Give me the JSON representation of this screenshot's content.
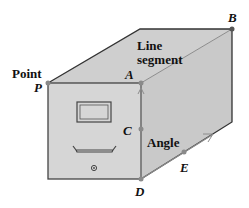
{
  "diagram": {
    "colors": {
      "fill": "#d4d4d4",
      "edge": "#333333",
      "point": "#8a8a8a",
      "accent_line": "#8c8c8c"
    },
    "terms": {
      "point": "Point",
      "line_segment_line1": "Line",
      "line_segment_line2": "segment",
      "angle": "Angle"
    },
    "points": {
      "P": "P",
      "A": "A",
      "B": "B",
      "C": "C",
      "D": "D",
      "E": "E"
    }
  }
}
